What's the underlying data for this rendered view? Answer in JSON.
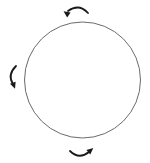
{
  "diagram": {
    "circle": {
      "cx": 82.5,
      "cy": 80,
      "r": 58,
      "stroke": "#6b6b6b",
      "stroke_width": 1
    },
    "arrow_color": "#1a1a1a",
    "rotation_direction": "counterclockwise",
    "arrows": [
      {
        "position": "top",
        "path": "M 88 13 Q 79 3 68 11",
        "head": {
          "x": 66,
          "y": 13,
          "angle": 215
        }
      },
      {
        "position": "left",
        "path": "M 16 66 Q 7 75 13 84",
        "head": {
          "x": 14,
          "y": 86,
          "angle": 70
        }
      },
      {
        "position": "bottom",
        "path": "M 70 151 Q 79 160 89 152",
        "head": {
          "x": 91,
          "y": 150,
          "angle": -40
        }
      }
    ]
  }
}
